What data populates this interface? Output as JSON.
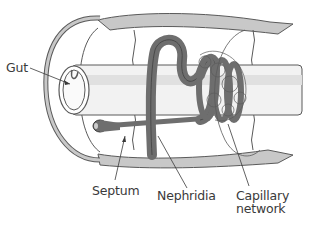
{
  "diagram": {
    "labels": {
      "gut": "Gut",
      "septum": "Septum",
      "nephridia": "Nephridia",
      "capillary_line1": "Capillary",
      "capillary_line2": "network"
    },
    "colors": {
      "outline": "#5a5a5a",
      "body_wall": "#c8c8c8",
      "nephridia": "#6e6e6e",
      "gut_shade": "#e6e6e6",
      "text": "#3a3a3a",
      "background": "#ffffff"
    }
  }
}
